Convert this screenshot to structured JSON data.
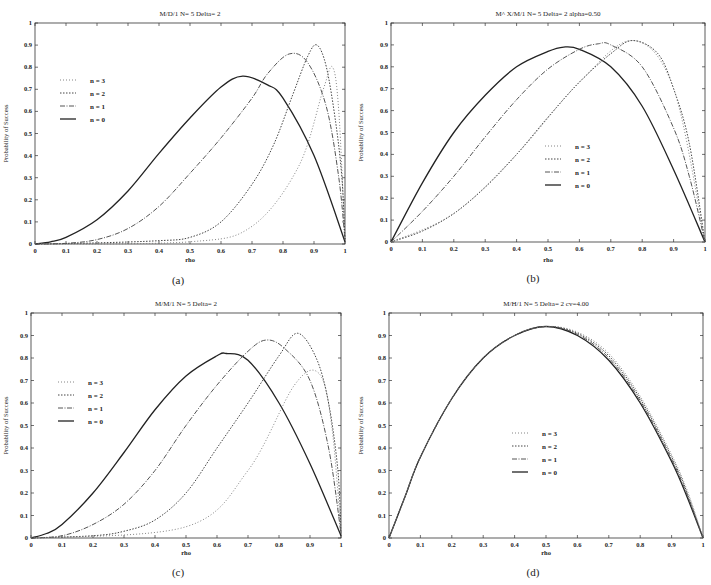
{
  "chart_data": [
    {
      "id": "a",
      "type": "line",
      "title": "M/D/1 N= 5 Delta= 2",
      "xlabel": "rho",
      "ylabel": "Probability of Success",
      "caption": "(a)",
      "xlim": [
        0,
        1
      ],
      "ylim": [
        0,
        1
      ],
      "xticks": [
        "0",
        "0.1",
        "0.2",
        "0.3",
        "0.4",
        "0.5",
        "0.6",
        "0.7",
        "0.8",
        "0.9",
        "1"
      ],
      "yticks": [
        "0",
        "0.1",
        "0.2",
        "0.3",
        "0.4",
        "0.5",
        "0.6",
        "0.7",
        "0.8",
        "0.9",
        "1"
      ],
      "grid": false,
      "legend_position": "upper-left",
      "legend": [
        "n = 3",
        "n = 2",
        "n = 1",
        "n = 0"
      ],
      "series": [
        {
          "name": "n = 0",
          "style": "solid",
          "x": [
            0,
            0.05,
            0.1,
            0.2,
            0.3,
            0.4,
            0.5,
            0.6,
            0.67,
            0.75,
            0.8,
            0.9,
            1.0
          ],
          "y": [
            0,
            0.01,
            0.03,
            0.11,
            0.24,
            0.41,
            0.57,
            0.71,
            0.76,
            0.72,
            0.66,
            0.4,
            0.01
          ]
        },
        {
          "name": "n = 1",
          "style": "dash-dot",
          "x": [
            0,
            0.1,
            0.2,
            0.3,
            0.4,
            0.5,
            0.6,
            0.7,
            0.75,
            0.82,
            0.88,
            0.94,
            0.98,
            1.0
          ],
          "y": [
            0,
            0.003,
            0.02,
            0.07,
            0.17,
            0.32,
            0.48,
            0.66,
            0.77,
            0.86,
            0.82,
            0.62,
            0.3,
            0.02
          ]
        },
        {
          "name": "n = 2",
          "style": "dotted",
          "x": [
            0,
            0.2,
            0.4,
            0.5,
            0.6,
            0.7,
            0.77,
            0.83,
            0.88,
            0.91,
            0.94,
            0.97,
            0.99,
            1.0
          ],
          "y": [
            0,
            0.005,
            0.015,
            0.03,
            0.1,
            0.27,
            0.45,
            0.67,
            0.85,
            0.9,
            0.8,
            0.55,
            0.3,
            0.02
          ]
        },
        {
          "name": "n = 3",
          "style": "dotted-fine",
          "x": [
            0,
            0.5,
            0.7,
            0.85,
            0.93,
            0.96,
            0.98,
            1.0
          ],
          "y": [
            0,
            0.01,
            0.08,
            0.35,
            0.7,
            0.8,
            0.6,
            0.02
          ]
        }
      ]
    },
    {
      "id": "b",
      "type": "line",
      "title": "M^ X/M/1 N= 5 Delta= 2 alpha=0.50",
      "xlabel": "rho",
      "ylabel": "Probability of Success",
      "caption": "(b)",
      "xlim": [
        0,
        1
      ],
      "ylim": [
        0,
        1
      ],
      "xticks": [
        "0",
        "0.1",
        "0.2",
        "0.3",
        "0.4",
        "0.5",
        "0.6",
        "0.7",
        "0.8",
        "0.9",
        "1"
      ],
      "yticks": [
        "0",
        "0.1",
        "0.2",
        "0.3",
        "0.4",
        "0.5",
        "0.6",
        "0.7",
        "0.8",
        "0.9",
        "1"
      ],
      "grid": false,
      "legend_position": "center",
      "legend": [
        "n = 3",
        "n = 2",
        "n = 1",
        "n = 0"
      ],
      "series": [
        {
          "name": "n = 0",
          "style": "solid",
          "x": [
            0,
            0.1,
            0.2,
            0.3,
            0.4,
            0.5,
            0.55,
            0.6,
            0.7,
            0.8,
            0.9,
            1.0
          ],
          "y": [
            0,
            0.27,
            0.5,
            0.67,
            0.8,
            0.87,
            0.89,
            0.88,
            0.8,
            0.62,
            0.33,
            0
          ]
        },
        {
          "name": "n = 1",
          "style": "dash-dot",
          "x": [
            0,
            0.1,
            0.2,
            0.3,
            0.4,
            0.5,
            0.6,
            0.66,
            0.7,
            0.8,
            0.9,
            0.95,
            1.0
          ],
          "y": [
            0,
            0.14,
            0.3,
            0.48,
            0.65,
            0.79,
            0.88,
            0.905,
            0.9,
            0.8,
            0.52,
            0.3,
            0
          ]
        },
        {
          "name": "n = 2",
          "style": "dotted",
          "x": [
            0,
            0.1,
            0.2,
            0.3,
            0.4,
            0.5,
            0.6,
            0.7,
            0.77,
            0.85,
            0.9,
            0.95,
            1.0
          ],
          "y": [
            0,
            0.05,
            0.13,
            0.25,
            0.4,
            0.57,
            0.73,
            0.86,
            0.92,
            0.86,
            0.7,
            0.45,
            0
          ]
        },
        {
          "name": "n = 3",
          "style": "dotted-fine",
          "x": [
            0,
            0.2,
            0.4,
            0.6,
            0.77,
            0.9,
            1.0
          ],
          "y": [
            0,
            0.13,
            0.4,
            0.73,
            0.92,
            0.7,
            0
          ]
        }
      ]
    },
    {
      "id": "c",
      "type": "line",
      "title": "M/M/1 N= 5 Delta= 2",
      "xlabel": "rho",
      "ylabel": "Probability of Success",
      "caption": "(c)",
      "xlim": [
        0,
        1
      ],
      "ylim": [
        0,
        1
      ],
      "xticks": [
        "0",
        "0.1",
        "0.2",
        "0.3",
        "0.4",
        "0.5",
        "0.6",
        "0.7",
        "0.8",
        "0.9",
        "1"
      ],
      "yticks": [
        "0",
        "0.1",
        "0.2",
        "0.3",
        "0.4",
        "0.5",
        "0.6",
        "0.7",
        "0.8",
        "0.9",
        "1"
      ],
      "grid": false,
      "legend_position": "left",
      "legend": [
        "n = 3",
        "n = 2",
        "n = 1",
        "n = 0"
      ],
      "series": [
        {
          "name": "n = 0",
          "style": "solid",
          "x": [
            0,
            0.05,
            0.1,
            0.2,
            0.3,
            0.4,
            0.5,
            0.6,
            0.63,
            0.7,
            0.8,
            0.9,
            1.0
          ],
          "y": [
            0,
            0.02,
            0.06,
            0.2,
            0.38,
            0.57,
            0.72,
            0.81,
            0.82,
            0.79,
            0.6,
            0.33,
            0.01
          ]
        },
        {
          "name": "n = 1",
          "style": "dash-dot",
          "x": [
            0,
            0.1,
            0.2,
            0.3,
            0.4,
            0.5,
            0.6,
            0.7,
            0.76,
            0.82,
            0.9,
            0.96,
            1.0
          ],
          "y": [
            0,
            0.01,
            0.06,
            0.15,
            0.3,
            0.5,
            0.68,
            0.83,
            0.88,
            0.84,
            0.7,
            0.4,
            0.02
          ]
        },
        {
          "name": "n = 2",
          "style": "dotted",
          "x": [
            0,
            0.2,
            0.3,
            0.4,
            0.5,
            0.6,
            0.7,
            0.8,
            0.86,
            0.92,
            0.96,
            0.99,
            1.0
          ],
          "y": [
            0,
            0.01,
            0.03,
            0.08,
            0.2,
            0.4,
            0.6,
            0.81,
            0.91,
            0.8,
            0.6,
            0.3,
            0.02
          ]
        },
        {
          "name": "n = 3",
          "style": "dotted-fine",
          "x": [
            0,
            0.5,
            0.7,
            0.85,
            0.93,
            0.97,
            1.0
          ],
          "y": [
            0,
            0.05,
            0.3,
            0.68,
            0.73,
            0.5,
            0.02
          ]
        }
      ]
    },
    {
      "id": "d",
      "type": "line",
      "title": "M/H/1 N= 5 Delta= 2 cv=4.00",
      "xlabel": "rho",
      "ylabel": "Probability of Success",
      "caption": "(d)",
      "xlim": [
        0,
        1
      ],
      "ylim": [
        0,
        1
      ],
      "xticks": [
        "0",
        "0.1",
        "0.2",
        "0.3",
        "0.4",
        "0.5",
        "0.6",
        "0.7",
        "0.8",
        "0.9",
        "1"
      ],
      "yticks": [
        "0",
        "0.1",
        "0.2",
        "0.3",
        "0.4",
        "0.5",
        "0.6",
        "0.7",
        "0.8",
        "0.9",
        "1"
      ],
      "grid": false,
      "legend_position": "center",
      "legend": [
        "n = 3",
        "n = 2",
        "n = 1",
        "n = 0"
      ],
      "series": [
        {
          "name": "n = 0",
          "style": "solid",
          "x": [
            0,
            0.05,
            0.1,
            0.2,
            0.3,
            0.4,
            0.5,
            0.6,
            0.7,
            0.8,
            0.9,
            0.95,
            1.0
          ],
          "y": [
            0,
            0.18,
            0.36,
            0.62,
            0.8,
            0.9,
            0.94,
            0.9,
            0.79,
            0.6,
            0.34,
            0.18,
            0
          ]
        },
        {
          "name": "n = 1",
          "style": "dash-dot",
          "x": [
            0,
            0.05,
            0.1,
            0.2,
            0.3,
            0.4,
            0.5,
            0.6,
            0.7,
            0.8,
            0.9,
            0.95,
            1.0
          ],
          "y": [
            0,
            0.18,
            0.36,
            0.62,
            0.8,
            0.9,
            0.94,
            0.905,
            0.8,
            0.61,
            0.35,
            0.19,
            0
          ]
        },
        {
          "name": "n = 2",
          "style": "dotted",
          "x": [
            0,
            0.05,
            0.1,
            0.2,
            0.3,
            0.4,
            0.5,
            0.6,
            0.7,
            0.8,
            0.9,
            0.95,
            1.0
          ],
          "y": [
            0,
            0.18,
            0.36,
            0.62,
            0.8,
            0.9,
            0.94,
            0.91,
            0.81,
            0.62,
            0.36,
            0.2,
            0
          ]
        },
        {
          "name": "n = 3",
          "style": "dotted-fine",
          "x": [
            0,
            0.05,
            0.1,
            0.2,
            0.3,
            0.4,
            0.5,
            0.6,
            0.7,
            0.8,
            0.9,
            0.95,
            1.0
          ],
          "y": [
            0,
            0.18,
            0.36,
            0.62,
            0.8,
            0.9,
            0.94,
            0.915,
            0.82,
            0.63,
            0.37,
            0.21,
            0
          ]
        }
      ]
    }
  ],
  "panels": [
    {
      "title": "M/D/1 N= 5 Delta= 2",
      "caption": "(a)",
      "xlabel": "rho",
      "ylabel": "Probability of Success"
    },
    {
      "title": "M^ X/M/1 N= 5 Delta= 2 alpha=0.50",
      "caption": "(b)",
      "xlabel": "rho",
      "ylabel": "Probability of Success"
    },
    {
      "title": "M/M/1 N= 5 Delta= 2",
      "caption": "(c)",
      "xlabel": "rho",
      "ylabel": "Probability of Success"
    },
    {
      "title": "M/H/1 N= 5 Delta= 2 cv=4.00",
      "caption": "(d)",
      "xlabel": "rho",
      "ylabel": "Probability of Success"
    }
  ]
}
